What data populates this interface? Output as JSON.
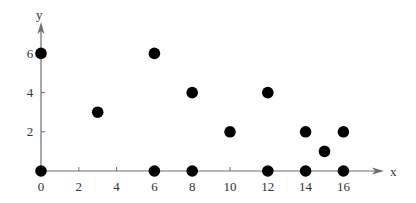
{
  "chart_data": {
    "type": "scatter",
    "title": "",
    "xlabel": "x",
    "ylabel": "y",
    "xlim": [
      0,
      18
    ],
    "ylim": [
      0,
      7.5
    ],
    "grid": false,
    "legend": null,
    "x_ticks": [
      0,
      2,
      4,
      6,
      8,
      10,
      12,
      14,
      16
    ],
    "y_ticks": [
      2,
      4,
      6
    ],
    "x_tick_labels": [
      "0",
      "2",
      "4",
      "6",
      "8",
      "10",
      "12",
      "14",
      "16"
    ],
    "y_tick_labels": [
      "2",
      "4",
      "6"
    ],
    "series": [
      {
        "name": "points",
        "marker": "filled-circle",
        "color": "#000000",
        "points": [
          {
            "x": 0,
            "y": 0
          },
          {
            "x": 0,
            "y": 6
          },
          {
            "x": 3,
            "y": 3
          },
          {
            "x": 6,
            "y": 0
          },
          {
            "x": 6,
            "y": 6
          },
          {
            "x": 8,
            "y": 0
          },
          {
            "x": 8,
            "y": 4
          },
          {
            "x": 10,
            "y": 2
          },
          {
            "x": 12,
            "y": 0
          },
          {
            "x": 12,
            "y": 4
          },
          {
            "x": 14,
            "y": 0
          },
          {
            "x": 14,
            "y": 2
          },
          {
            "x": 15,
            "y": 1
          },
          {
            "x": 16,
            "y": 0
          },
          {
            "x": 16,
            "y": 2
          }
        ]
      }
    ]
  },
  "style": {
    "axis_color": "#6e6e6e",
    "marker_color": "#000000",
    "text_color": "#333333"
  }
}
